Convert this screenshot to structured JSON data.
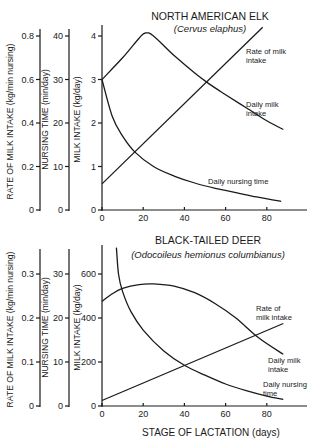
{
  "chart_data": [
    {
      "type": "line",
      "title": "NORTH AMERICAN ELK",
      "subtitle": "(Cervus elaphus)",
      "xlabel": "",
      "xlim": [
        0,
        95
      ],
      "xticks": [
        0,
        20,
        40,
        60,
        80
      ],
      "y_axes": [
        {
          "label": "RATE OF MILK INTAKE (kg/min nursing)",
          "ticks": [
            0,
            0.2,
            0.4,
            0.6,
            0.8
          ],
          "tick_labels": [
            "0",
            "0.2",
            "0.4",
            "0.6",
            "0.8"
          ],
          "ylim": [
            0,
            0.8
          ]
        },
        {
          "label": "NURSING TIME (min/day)",
          "ticks": [
            0,
            10,
            20,
            30,
            40
          ],
          "tick_labels": [
            "0",
            "10",
            "20",
            "30",
            "40"
          ],
          "ylim": [
            0,
            40
          ]
        },
        {
          "label": "MILK INTAKE (kg/day)",
          "ticks": [
            0,
            1,
            2,
            3,
            4
          ],
          "tick_labels": [
            "0",
            "1",
            "2",
            "3",
            "4"
          ],
          "ylim": [
            0,
            4
          ]
        }
      ],
      "series": [
        {
          "name": "Daily milk intake",
          "axis": "MILK INTAKE (kg/day)",
          "x": [
            0,
            10,
            18,
            21,
            25,
            35,
            45,
            52,
            60,
            70,
            80,
            88
          ],
          "y": [
            3.0,
            3.5,
            3.95,
            4.07,
            4.0,
            3.55,
            3.15,
            2.9,
            2.65,
            2.35,
            2.05,
            1.85
          ]
        },
        {
          "name": "Rate of milk intake",
          "axis": "MILK INTAKE (kg/day)",
          "x": [
            0,
            78
          ],
          "y": [
            0.6,
            4.2
          ]
        },
        {
          "name": "Daily nursing time",
          "axis": "MILK INTAKE (kg/day)",
          "x": [
            0,
            5,
            10,
            16,
            25,
            35,
            45,
            55,
            65,
            75,
            87
          ],
          "y": [
            3.0,
            2.15,
            1.7,
            1.33,
            1.0,
            0.78,
            0.62,
            0.5,
            0.4,
            0.3,
            0.2
          ]
        }
      ],
      "annotations": [
        {
          "text": [
            "Rate of milk",
            "intake"
          ],
          "x": 246,
          "y": 54
        },
        {
          "text": [
            "Daily milk",
            "intake"
          ],
          "x": 246,
          "y": 107
        },
        {
          "text": [
            "Daily nursing time"
          ],
          "x": 208,
          "y": 184
        }
      ]
    },
    {
      "type": "line",
      "title": "BLACK-TAILED DEER",
      "subtitle": "(Odocoileus hemionus columbianus)",
      "xlabel": "STAGE OF LACTATION (days)",
      "xlim": [
        0,
        95
      ],
      "xticks": [
        0,
        20,
        40,
        60,
        80
      ],
      "y_axes": [
        {
          "label": "RATE OF MILK INTAKE (kg/min nursing)",
          "ticks": [
            0,
            0.1,
            0.2,
            0.3
          ],
          "tick_labels": [
            "0",
            "0.1",
            "0.2",
            "0.3"
          ],
          "ylim": [
            0,
            0.3
          ]
        },
        {
          "label": "NURSING TIME (min/day)",
          "ticks": [
            0,
            10,
            20,
            30
          ],
          "tick_labels": [
            "0",
            "10",
            "20",
            "30"
          ],
          "ylim": [
            0,
            30
          ]
        },
        {
          "label": "MILK INTAKE (kg/day)",
          "ticks": [
            0,
            200,
            400,
            600
          ],
          "tick_labels": [
            "0",
            "200",
            "400",
            "600"
          ],
          "ylim": [
            0,
            600
          ]
        }
      ],
      "series": [
        {
          "name": "Daily milk intake",
          "axis": "MILK INTAKE (kg/day)",
          "x": [
            0,
            5,
            10,
            18,
            25,
            35,
            45,
            55,
            65,
            76,
            88
          ],
          "y": [
            475,
            510,
            535,
            552,
            555,
            545,
            515,
            465,
            400,
            310,
            235
          ]
        },
        {
          "name": "Rate of milk intake",
          "axis": "MILK INTAKE (kg/day)",
          "x": [
            0,
            88
          ],
          "y": [
            25,
            375
          ]
        },
        {
          "name": "Daily nursing time",
          "axis": "MILK INTAKE (kg/day)",
          "x": [
            7,
            8,
            10,
            14,
            20,
            30,
            40,
            50,
            60,
            70,
            80,
            88
          ],
          "y": [
            720,
            600,
            520,
            430,
            345,
            250,
            185,
            140,
            100,
            70,
            45,
            30
          ]
        }
      ],
      "annotations": [
        {
          "text": [
            "Rate of",
            "milk intake"
          ],
          "x": 256,
          "y": 311
        },
        {
          "text": [
            "Daily milk",
            "intake"
          ],
          "x": 268,
          "y": 363
        },
        {
          "text": [
            "Daily nursing",
            "time"
          ],
          "x": 263,
          "y": 387
        }
      ]
    }
  ],
  "figure": {
    "panels": [
      {
        "title": "NORTH AMERICAN ELK",
        "subtitle": "(Cervus elaphus)"
      },
      {
        "title": "BLACK-TAILED DEER",
        "subtitle": "(Odocoileus hemionus columbianus)"
      }
    ],
    "xlabel": "STAGE OF LACTATION (days)"
  }
}
